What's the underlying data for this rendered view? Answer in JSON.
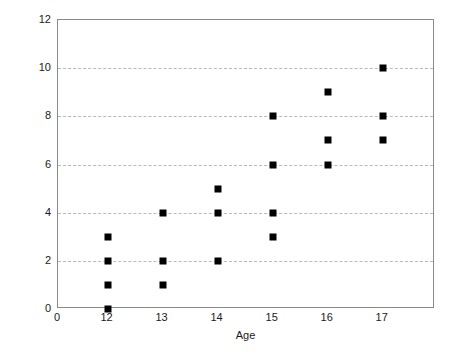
{
  "chart_data": {
    "type": "scatter",
    "title": "",
    "xlabel": "Age",
    "ylabel": "Number of Delinquent Acts",
    "xlim": [
      11.1,
      17.95
    ],
    "ylim": [
      0,
      12
    ],
    "x_tick_labels": [
      "0",
      "12",
      "13",
      "14",
      "15",
      "16",
      "17"
    ],
    "x_tick_values": [
      11.1,
      12,
      13,
      14,
      15,
      16,
      17
    ],
    "y_tick_labels": [
      "0",
      "2",
      "4",
      "6",
      "8",
      "10",
      "12"
    ],
    "y_tick_values": [
      0,
      2,
      4,
      6,
      8,
      10,
      12
    ],
    "grid": "horizontal-dashed",
    "gridline_values": [
      2,
      4,
      6,
      8,
      10
    ],
    "legend": "none",
    "marker_color": "#000000",
    "marker_shape": "square",
    "axis_color": "#8a8a8a",
    "grid_color": "#b9b9b9",
    "background_color": "#ffffff",
    "x": [
      12,
      12,
      12,
      12,
      13,
      13,
      13,
      14,
      14,
      14,
      15,
      15,
      15,
      15,
      16,
      16,
      16,
      17,
      17,
      17
    ],
    "y": [
      0,
      1,
      2,
      3,
      1,
      2,
      4,
      2,
      4,
      5,
      3,
      4,
      6,
      8,
      6,
      7,
      9,
      7,
      8,
      10
    ],
    "points": [
      {
        "x": 12,
        "y": 0
      },
      {
        "x": 12,
        "y": 1
      },
      {
        "x": 12,
        "y": 2
      },
      {
        "x": 12,
        "y": 3
      },
      {
        "x": 13,
        "y": 1
      },
      {
        "x": 13,
        "y": 2
      },
      {
        "x": 13,
        "y": 4
      },
      {
        "x": 14,
        "y": 2
      },
      {
        "x": 14,
        "y": 4
      },
      {
        "x": 14,
        "y": 5
      },
      {
        "x": 15,
        "y": 3
      },
      {
        "x": 15,
        "y": 4
      },
      {
        "x": 15,
        "y": 6
      },
      {
        "x": 15,
        "y": 8
      },
      {
        "x": 16,
        "y": 6
      },
      {
        "x": 16,
        "y": 7
      },
      {
        "x": 16,
        "y": 9
      },
      {
        "x": 17,
        "y": 7
      },
      {
        "x": 17,
        "y": 8
      },
      {
        "x": 17,
        "y": 10
      }
    ]
  }
}
